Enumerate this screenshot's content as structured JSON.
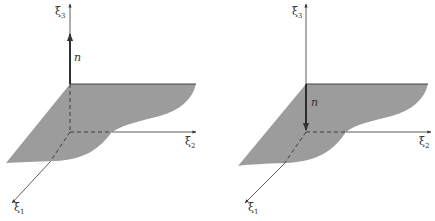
{
  "figures": [
    {
      "id": "left",
      "description": "Plane surface with normal n pointing upward along xi3",
      "axes": {
        "x1": "ξ",
        "x1_sub": "1",
        "x2": "ξ",
        "x2_sub": "2",
        "x3": "ξ",
        "x3_sub": "3"
      },
      "normal_label": "n",
      "normal_direction": "up"
    },
    {
      "id": "right",
      "description": "Plane surface with normal n pointing downward",
      "axes": {
        "x1": "ξ",
        "x1_sub": "1",
        "x2": "ξ",
        "x2_sub": "2",
        "x3": "ξ",
        "x3_sub": "3"
      },
      "normal_label": "n",
      "normal_direction": "down"
    }
  ],
  "colors": {
    "surface": "#9c9c9c",
    "axis": "#333333",
    "background": "#ffffff"
  }
}
